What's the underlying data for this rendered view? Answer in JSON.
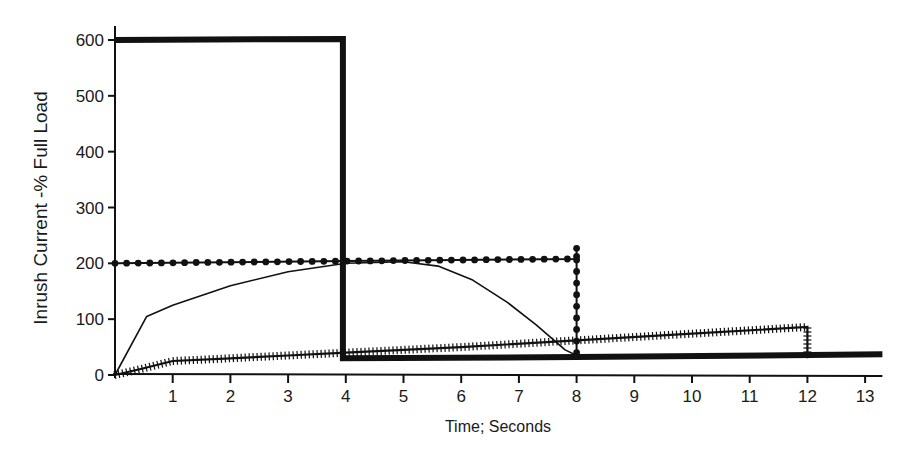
{
  "chart_data": {
    "type": "line",
    "title": "",
    "xlabel": "Time; Seconds",
    "ylabel": "Inrush Current -% Full Load",
    "xlim": [
      0,
      13.3
    ],
    "ylim": [
      0,
      620
    ],
    "grid": false,
    "legend": "none",
    "x_ticks": [
      1,
      2,
      3,
      4,
      5,
      6,
      7,
      8,
      9,
      10,
      11,
      12,
      13
    ],
    "x_tick_labels": [
      "1",
      "2",
      "3",
      "4",
      "5",
      "6",
      "7",
      "8",
      "9",
      "10",
      "11",
      "12",
      "13"
    ],
    "y_ticks": [
      0,
      100,
      200,
      300,
      400,
      500,
      600
    ],
    "y_tick_labels": [
      "0",
      "100",
      "200",
      "300",
      "400",
      "500",
      "600"
    ],
    "series": [
      {
        "name": "thick-solid",
        "style": "thick",
        "color": "#111111",
        "points": [
          [
            0,
            600
          ],
          [
            3.95,
            602
          ],
          [
            3.95,
            30
          ],
          [
            8,
            32
          ],
          [
            13.3,
            37
          ]
        ]
      },
      {
        "name": "dotted-circles",
        "style": "dots",
        "color": "#111111",
        "points": [
          [
            0,
            200
          ],
          [
            4,
            204
          ],
          [
            8,
            208
          ],
          [
            8,
            230
          ],
          [
            8,
            35
          ]
        ]
      },
      {
        "name": "thin-curve",
        "style": "thin",
        "color": "#111111",
        "points": [
          [
            0,
            0
          ],
          [
            0.55,
            105
          ],
          [
            1,
            125
          ],
          [
            2,
            160
          ],
          [
            3,
            185
          ],
          [
            4,
            200
          ],
          [
            5,
            203
          ],
          [
            5.6,
            195
          ],
          [
            6.2,
            170
          ],
          [
            6.8,
            130
          ],
          [
            7.3,
            90
          ],
          [
            7.8,
            45
          ],
          [
            8.1,
            30
          ]
        ]
      },
      {
        "name": "cross-hatched",
        "style": "hatched",
        "color": "#111111",
        "points": [
          [
            0,
            0
          ],
          [
            0.5,
            12
          ],
          [
            1,
            25
          ],
          [
            2,
            30
          ],
          [
            3,
            35
          ],
          [
            4,
            40
          ],
          [
            6,
            50
          ],
          [
            8,
            62
          ],
          [
            10,
            74
          ],
          [
            12,
            86
          ],
          [
            12,
            30
          ]
        ]
      }
    ]
  }
}
